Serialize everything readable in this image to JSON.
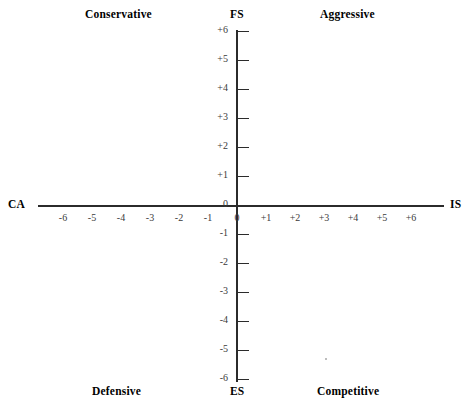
{
  "chart_data": {
    "type": "scatter",
    "xlabel": "",
    "ylabel": "",
    "xlim": [
      -6,
      6
    ],
    "ylim": [
      -6,
      6
    ],
    "grid": false,
    "legend": "none",
    "axes": {
      "vertical_top_label": "FS",
      "vertical_bottom_label": "ES",
      "horizontal_left_label": "CA",
      "horizontal_right_label": "IS"
    },
    "quadrants": [
      {
        "name": "Conservative",
        "position": "top-left"
      },
      {
        "name": "Aggressive",
        "position": "top-right"
      },
      {
        "name": "Defensive",
        "position": "bottom-left"
      },
      {
        "name": "Competitive",
        "position": "bottom-right"
      }
    ],
    "y_ticks": [
      "+6",
      "+5",
      "+4",
      "+3",
      "+2",
      "+1",
      "0",
      "-1",
      "-2",
      "-3",
      "-4",
      "-5",
      "-6"
    ],
    "y_tick_values": [
      6,
      5,
      4,
      3,
      2,
      1,
      0,
      -1,
      -2,
      -3,
      -4,
      -5,
      -6
    ],
    "x_ticks": [
      "-6",
      "-5",
      "-4",
      "-3",
      "-2",
      "-1",
      "0",
      "+1",
      "+2",
      "+3",
      "+4",
      "+5",
      "+6"
    ],
    "x_tick_values": [
      -6,
      -5,
      -4,
      -3,
      -2,
      -1,
      0,
      1,
      2,
      3,
      4,
      5,
      6
    ],
    "series": [],
    "values": [],
    "colors": {
      "axis": "#2b2b2b",
      "label": "#000000",
      "tick_label": "#3a3a3a",
      "background": "#ffffff"
    }
  },
  "quadrant_labels": {
    "conservative": "Conservative",
    "aggressive": "Aggressive",
    "defensive": "Defensive",
    "competitive": "Competitive"
  },
  "axis_labels": {
    "fs": "FS",
    "es": "ES",
    "ca": "CA",
    "is": "IS"
  },
  "y_axis": {
    "ticks": [
      {
        "label": "+6",
        "value": 6
      },
      {
        "label": "+5",
        "value": 5
      },
      {
        "label": "+4",
        "value": 4
      },
      {
        "label": "+3",
        "value": 3
      },
      {
        "label": "+2",
        "value": 2
      },
      {
        "label": "+1",
        "value": 1
      },
      {
        "label": "0",
        "value": 0
      },
      {
        "label": "-1",
        "value": -1
      },
      {
        "label": "-2",
        "value": -2
      },
      {
        "label": "-3",
        "value": -3
      },
      {
        "label": "-4",
        "value": -4
      },
      {
        "label": "-5",
        "value": -5
      },
      {
        "label": "-6",
        "value": -6
      }
    ]
  },
  "x_axis": {
    "ticks": [
      {
        "label": "-6",
        "value": -6
      },
      {
        "label": "-5",
        "value": -5
      },
      {
        "label": "-4",
        "value": -4
      },
      {
        "label": "-3",
        "value": -3
      },
      {
        "label": "-2",
        "value": -2
      },
      {
        "label": "-1",
        "value": -1
      },
      {
        "label": "0",
        "value": 0
      },
      {
        "label": "+1",
        "value": 1
      },
      {
        "label": "+2",
        "value": 2
      },
      {
        "label": "+3",
        "value": 3
      },
      {
        "label": "+4",
        "value": 4
      },
      {
        "label": "+5",
        "value": 5
      },
      {
        "label": "+6",
        "value": 6
      }
    ]
  }
}
